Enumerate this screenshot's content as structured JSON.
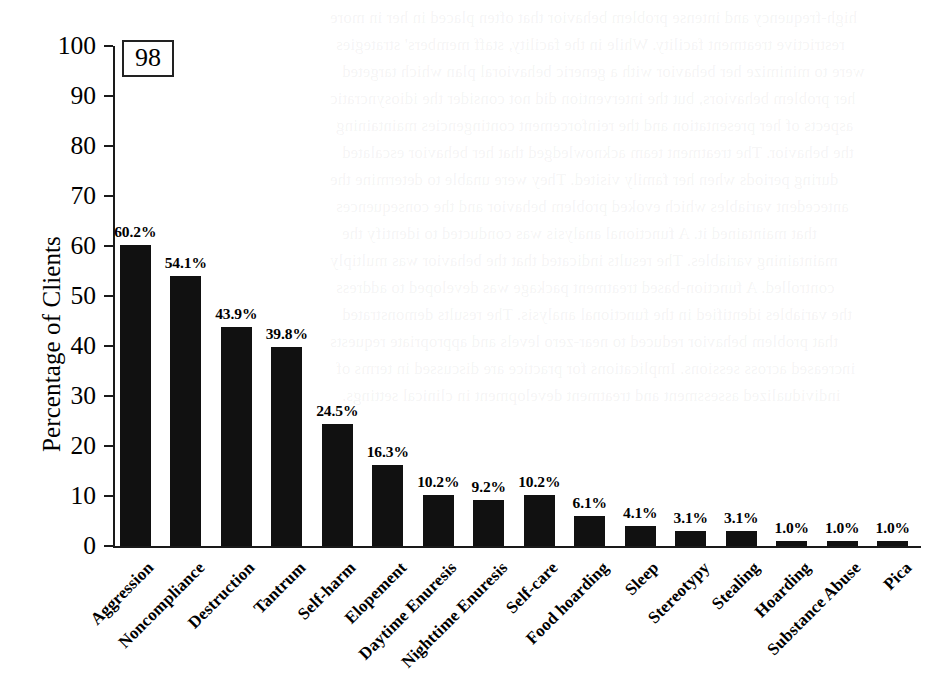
{
  "figure": {
    "number_badge": "98"
  },
  "chart_data": {
    "type": "bar",
    "title": "",
    "xlabel": "",
    "ylabel": "Percentage of Clients",
    "ylim": [
      0,
      100
    ],
    "ytick_step": 10,
    "grid": false,
    "legend": null,
    "value_suffix": "%",
    "categories": [
      "Aggression",
      "Noncompliance",
      "Destruction",
      "Tantrum",
      "Self-harm",
      "Elopement",
      "Daytime Enuresis",
      "Nighttime Enuresis",
      "Self-care",
      "Food hoarding",
      "Sleep",
      "Stereotypy",
      "Stealing",
      "Hoarding",
      "Substance Abuse",
      "Pica"
    ],
    "values": [
      60.2,
      54.1,
      43.9,
      39.8,
      24.5,
      16.3,
      10.2,
      9.2,
      10.2,
      6.1,
      4.1,
      3.1,
      3.1,
      1.0,
      1.0,
      1.0
    ],
    "value_labels": [
      "60.2%",
      "54.1%",
      "43.9%",
      "39.8%",
      "24.5%",
      "16.3%",
      "10.2%",
      "9.2%",
      "10.2%",
      "6.1%",
      "4.1%",
      "3.1%",
      "3.1%",
      "1.0%",
      "1.0%",
      "1.0%"
    ],
    "ytick_labels": [
      "0",
      "10",
      "20",
      "30",
      "40",
      "50",
      "60",
      "70",
      "80",
      "90",
      "100"
    ],
    "bar_color": "#111111",
    "axis_color": "#1a1a1a",
    "background_color": "#ffffff"
  },
  "ghost_text": {
    "lines": [
      "high-frequency and intense problem behavior that often placed in her in more",
      "restrictive treatment facility. While in the facility, staff members' strategies",
      "were to minimize her behavior with a generic behavioral plan which targeted",
      "her problem behaviors, but the intervention did not consider the idiosyncratic",
      "aspects of her presentation and the reinforcement contingencies maintaining",
      "the behavior. The treatment team acknowledged that her behavior escalated",
      "during periods when her family visited. They were unable to determine the",
      "antecedent variables which evoked problem behavior and the consequences",
      "that maintained it. A functional analysis was conducted to identify the",
      "maintaining variables. The results indicated that the behavior was multiply",
      "controlled. A function-based treatment package was developed to address",
      "the variables identified in the functional analysis. The results demonstrated",
      "that problem behavior reduced to near-zero levels and appropriate requests",
      "increased across sessions. Implications for practice are discussed in terms of",
      "individualized assessment and treatment development in clinical settings."
    ]
  }
}
